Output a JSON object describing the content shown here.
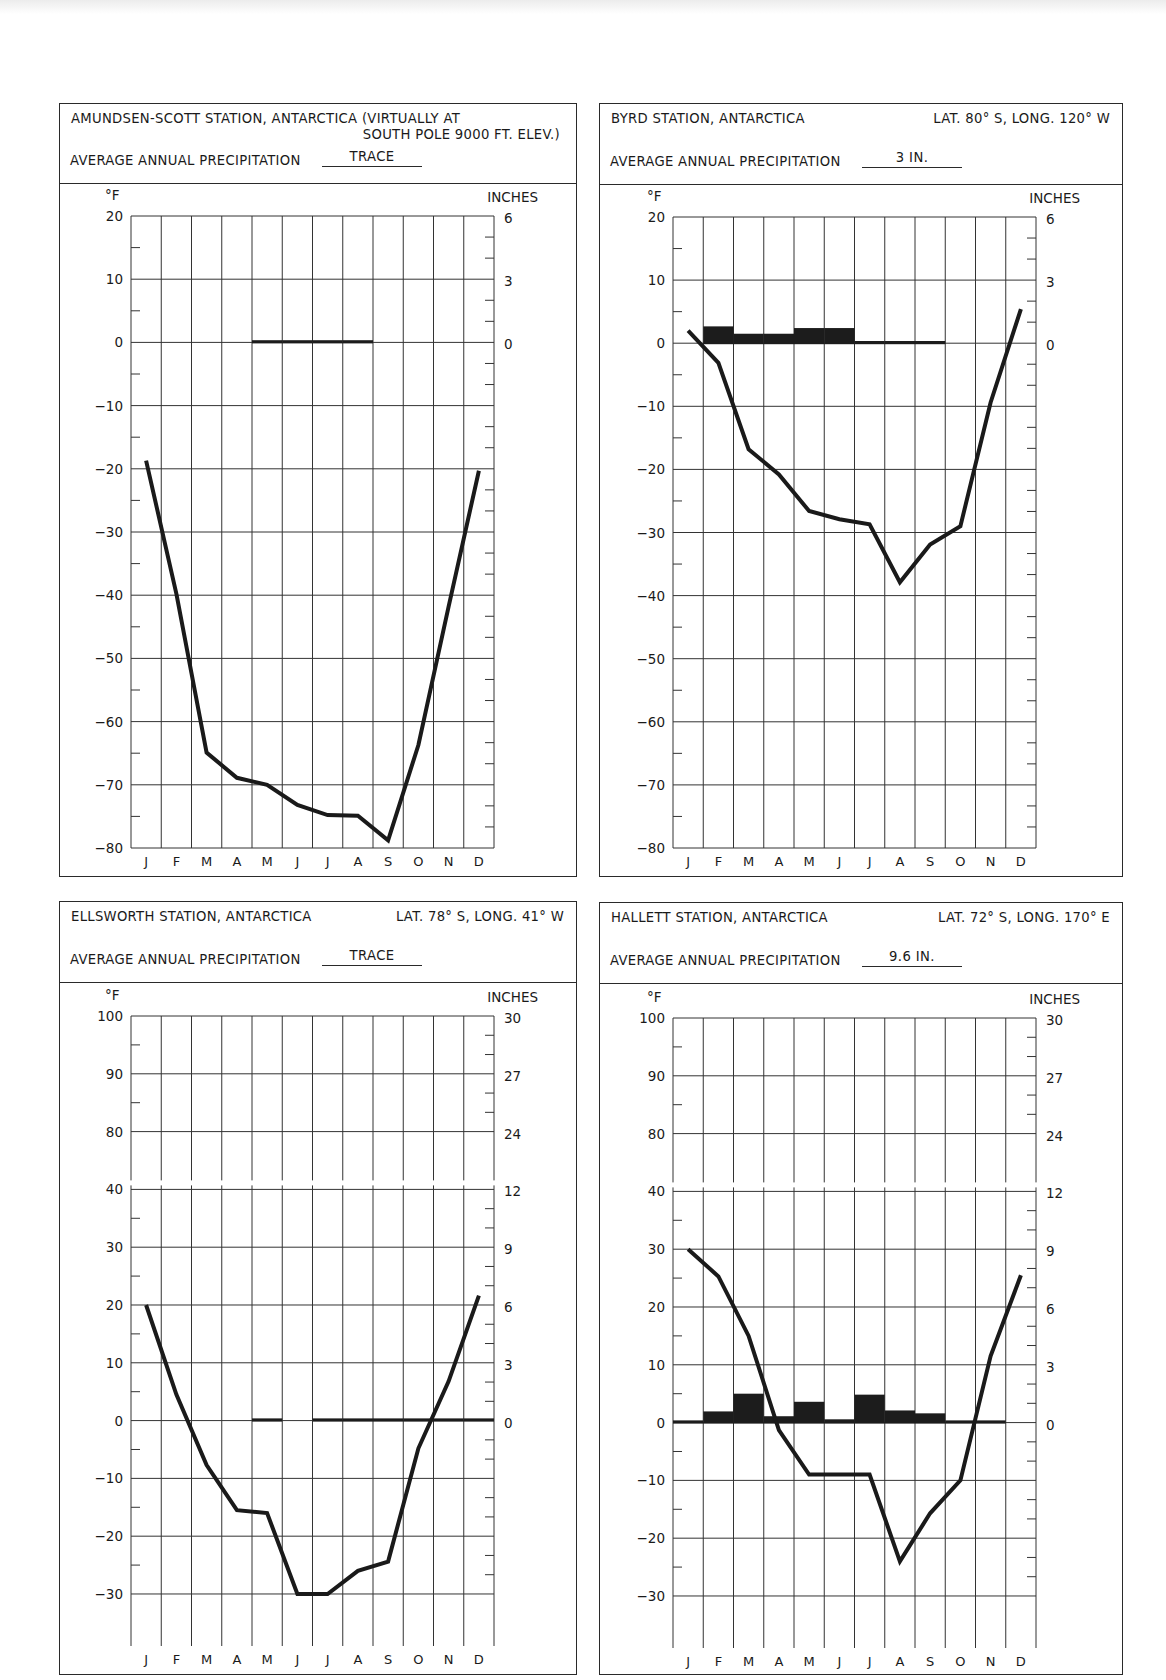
{
  "panels": [
    {
      "id": "amundsen",
      "title_line1": "AMUNDSEN-SCOTT STATION, ANTARCTICA (VIRTUALLY AT",
      "title_line2": "SOUTH POLE  9000 FT. ELEV.)",
      "coords": "",
      "precip_label": "AVERAGE ANNUAL  PRECIPITATION",
      "precip_value": "TRACE",
      "left_unit": "°F",
      "right_unit": "INCHES",
      "box": {
        "x": 59,
        "y": 103,
        "w": 518,
        "h": 774,
        "hdr_h": 79
      },
      "plot": {
        "x": 131,
        "y": 216,
        "w": 363,
        "h": 632
      },
      "scale_type": "simple",
      "y_ticks": [
        20,
        10,
        0,
        -10,
        -20,
        -30,
        -40,
        -50,
        -60,
        -70,
        -80
      ],
      "right_ticks": [
        {
          "t": 20,
          "label": "6"
        },
        {
          "t": 10,
          "label": "3"
        },
        {
          "t": 0,
          "label": "0"
        }
      ]
    },
    {
      "id": "byrd",
      "title_line1": "BYRD STATION, ANTARCTICA",
      "title_line2": "",
      "coords": "LAT. 80° S, LONG. 120° W",
      "precip_label": "AVERAGE ANNUAL  PRECIPITATION",
      "precip_value": "3 IN.",
      "left_unit": "°F",
      "right_unit": "INCHES",
      "box": {
        "x": 599,
        "y": 103,
        "w": 524,
        "h": 774,
        "hdr_h": 80
      },
      "plot": {
        "x": 673,
        "y": 217,
        "w": 363,
        "h": 631
      },
      "scale_type": "simple",
      "y_ticks": [
        20,
        10,
        0,
        -10,
        -20,
        -30,
        -40,
        -50,
        -60,
        -70,
        -80
      ],
      "right_ticks": [
        {
          "t": 20,
          "label": "6"
        },
        {
          "t": 10,
          "label": "3"
        },
        {
          "t": 0,
          "label": "0"
        }
      ]
    },
    {
      "id": "ellsworth",
      "title_line1": "ELLSWORTH STATION, ANTARCTICA",
      "title_line2": "",
      "coords": "LAT. 78° S, LONG. 41° W",
      "precip_label": "AVERAGE ANNUAL  PRECIPITATION",
      "precip_value": "TRACE",
      "left_unit": "°F",
      "right_unit": "INCHES",
      "box": {
        "x": 59,
        "y": 901,
        "w": 518,
        "h": 774,
        "hdr_h": 80
      },
      "plot": {
        "x": 131,
        "y": 1016,
        "w": 363,
        "h": 630
      },
      "scale_type": "broken",
      "y_ticks": [
        100,
        90,
        80,
        40,
        30,
        20,
        10,
        0,
        -10,
        -20,
        -30
      ],
      "right_ticks": [
        {
          "t": 100,
          "label": "30"
        },
        {
          "t": 90,
          "label": "27"
        },
        {
          "t": 80,
          "label": "24"
        },
        {
          "t": 40,
          "label": "12"
        },
        {
          "t": 30,
          "label": "9"
        },
        {
          "t": 20,
          "label": "6"
        },
        {
          "t": 10,
          "label": "3"
        },
        {
          "t": 0,
          "label": "0"
        }
      ]
    },
    {
      "id": "hallett",
      "title_line1": "HALLETT STATION, ANTARCTICA",
      "title_line2": "",
      "coords": "LAT. 72° S, LONG. 170° E",
      "precip_label": "AVERAGE ANNUAL  PRECIPITATION",
      "precip_value": "9.6 IN.",
      "left_unit": "°F",
      "right_unit": "INCHES",
      "box": {
        "x": 599,
        "y": 902,
        "w": 524,
        "h": 773,
        "hdr_h": 80
      },
      "plot": {
        "x": 673,
        "y": 1018,
        "w": 363,
        "h": 630
      },
      "scale_type": "broken",
      "y_ticks": [
        100,
        90,
        80,
        40,
        30,
        20,
        10,
        0,
        -10,
        -20,
        -30
      ],
      "right_ticks": [
        {
          "t": 100,
          "label": "30"
        },
        {
          "t": 90,
          "label": "27"
        },
        {
          "t": 80,
          "label": "24"
        },
        {
          "t": 40,
          "label": "12"
        },
        {
          "t": 30,
          "label": "9"
        },
        {
          "t": 20,
          "label": "6"
        },
        {
          "t": 10,
          "label": "3"
        },
        {
          "t": 0,
          "label": "0"
        }
      ]
    }
  ],
  "months": [
    "J",
    "F",
    "M",
    "A",
    "M",
    "J",
    "J",
    "A",
    "S",
    "O",
    "N",
    "D"
  ],
  "chart_data": [
    {
      "type": "line+bar",
      "title": "AMUNDSEN-SCOTT STATION, ANTARCTICA (VIRTUALLY AT SOUTH POLE 9000 FT. ELEV.)",
      "subtitle": "AVERAGE ANNUAL PRECIPITATION: TRACE",
      "categories": [
        "J",
        "F",
        "M",
        "A",
        "M",
        "J",
        "J",
        "A",
        "S",
        "O",
        "N",
        "D"
      ],
      "xlabel": "",
      "ylabel_left": "°F",
      "ylabel_right": "INCHES",
      "ylim_left": [
        -80,
        20
      ],
      "ylim_right": [
        0,
        6
      ],
      "grid": true,
      "series": [
        {
          "name": "Temperature (°F)",
          "axis": "left",
          "kind": "line",
          "values": [
            -18.7,
            -39.8,
            -64.9,
            -68.9,
            -70,
            -73.2,
            -74.8,
            -74.9,
            -78.8,
            -63.7,
            -41.8,
            -20.3
          ]
        },
        {
          "name": "Precipitation (in.)",
          "axis": "right",
          "kind": "bar",
          "values": [
            0,
            0,
            0,
            0,
            0.05,
            0.05,
            0.05,
            0.05,
            0,
            0,
            0,
            0
          ]
        }
      ]
    },
    {
      "type": "line+bar",
      "title": "BYRD STATION, ANTARCTICA",
      "subtitle": "AVERAGE ANNUAL PRECIPITATION: 3 IN.",
      "annotation": "LAT. 80° S, LONG. 120° W",
      "categories": [
        "J",
        "F",
        "M",
        "A",
        "M",
        "J",
        "J",
        "A",
        "S",
        "O",
        "N",
        "D"
      ],
      "ylabel_left": "°F",
      "ylabel_right": "INCHES",
      "ylim_left": [
        -80,
        20
      ],
      "ylim_right": [
        0,
        6
      ],
      "grid": true,
      "series": [
        {
          "name": "Temperature (°F)",
          "axis": "left",
          "kind": "line",
          "values": [
            2,
            -3.1,
            -16.8,
            -20.8,
            -26.6,
            -27.9,
            -28.7,
            -37.9,
            -31.9,
            -29,
            -9.4,
            5.4
          ]
        },
        {
          "name": "Precipitation (in.)",
          "axis": "right",
          "kind": "bar",
          "values": [
            0,
            0.8,
            0.45,
            0.45,
            0.72,
            0.72,
            0.1,
            0.08,
            0.06,
            0,
            0,
            0
          ]
        }
      ]
    },
    {
      "type": "line+bar",
      "title": "ELLSWORTH STATION, ANTARCTICA",
      "subtitle": "AVERAGE ANNUAL PRECIPITATION: TRACE",
      "annotation": "LAT. 78° S, LONG. 41° W",
      "categories": [
        "J",
        "F",
        "M",
        "A",
        "M",
        "J",
        "J",
        "A",
        "S",
        "O",
        "N",
        "D"
      ],
      "ylabel_left": "°F",
      "ylabel_right": "INCHES",
      "ylim_left": [
        -30,
        100
      ],
      "axis_break": "between 40 and 80 °F (12 and 24 in.)",
      "ylim_right": [
        0,
        30
      ],
      "grid": true,
      "series": [
        {
          "name": "Temperature (°F)",
          "axis": "left",
          "kind": "line",
          "values": [
            20,
            4.5,
            -7.7,
            -15.5,
            -16,
            -30,
            -30,
            -26,
            -24.4,
            -4.8,
            6.8,
            21.6
          ]
        },
        {
          "name": "Precipitation (in.)",
          "axis": "right",
          "kind": "bar",
          "values": [
            0,
            0,
            0,
            0,
            0.05,
            0,
            0.03,
            0.03,
            0.03,
            0.08,
            0.03,
            0.08
          ]
        }
      ]
    },
    {
      "type": "line+bar",
      "title": "HALLETT STATION, ANTARCTICA",
      "subtitle": "AVERAGE ANNUAL PRECIPITATION: 9.6 IN.",
      "annotation": "LAT. 72° S, LONG. 170° E",
      "categories": [
        "J",
        "F",
        "M",
        "A",
        "M",
        "J",
        "J",
        "A",
        "S",
        "O",
        "N",
        "D"
      ],
      "ylabel_left": "°F",
      "ylabel_right": "INCHES",
      "ylim_left": [
        -30,
        100
      ],
      "axis_break": "between 40 and 80 °F (12 and 24 in.)",
      "ylim_right": [
        0,
        30
      ],
      "grid": true,
      "series": [
        {
          "name": "Temperature (°F)",
          "axis": "left",
          "kind": "line",
          "values": [
            30,
            25.3,
            15,
            -1.3,
            -9,
            -9,
            -9,
            -24,
            -15.7,
            -10,
            11.5,
            25.5
          ]
        },
        {
          "name": "Precipitation (in.)",
          "axis": "right",
          "kind": "bar",
          "values": [
            0.05,
            0.58,
            1.5,
            0.33,
            1.08,
            0.17,
            1.45,
            0.63,
            0.48,
            0.03,
            0.03,
            0
          ]
        }
      ]
    }
  ]
}
